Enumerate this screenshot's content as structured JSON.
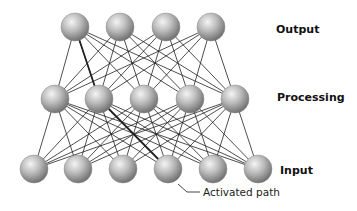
{
  "diagram": {
    "layers": [
      {
        "id": "output",
        "label": "Output",
        "y": 27,
        "nodes_x": [
          75,
          120,
          166,
          211
        ],
        "label_x": 276,
        "label_y": 33
      },
      {
        "id": "processing",
        "label": "Processing",
        "y": 99,
        "nodes_x": [
          55,
          99,
          144,
          190,
          235
        ],
        "label_x": 277,
        "label_y": 101
      },
      {
        "id": "input",
        "label": "Input",
        "y": 169,
        "nodes_x": [
          34,
          78,
          123,
          168,
          213,
          258
        ],
        "label_x": 280,
        "label_y": 174
      }
    ],
    "node_radius": 14,
    "edge_color": "#222222",
    "node_colors": {
      "highlight": "#f2f2f2",
      "mid": "#b8b8b8",
      "shadow": "#6e6e6e"
    },
    "activated_path": {
      "label": "Activated path",
      "edges": [
        {
          "from_layer": "input",
          "from": 3,
          "to_layer": "processing",
          "to": 1
        },
        {
          "from_layer": "processing",
          "from": 1,
          "to_layer": "output",
          "to": 0
        }
      ],
      "leader": [
        [
          178,
          184
        ],
        [
          187,
          192
        ],
        [
          200,
          192
        ]
      ],
      "label_x": 203,
      "label_y": 196
    }
  }
}
